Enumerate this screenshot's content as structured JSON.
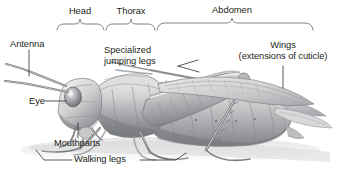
{
  "figure": {
    "background_color": "#ffffff",
    "label_color": "#231f20",
    "rule_color": "#6d6e71",
    "art_ink": "#808285"
  },
  "body_region_brackets": [
    {
      "id": "head",
      "label": "Head",
      "x_start": 57,
      "x_end": 104,
      "label_x": 80,
      "label_y": 6
    },
    {
      "id": "thorax",
      "label": "Thorax",
      "x_start": 106,
      "x_end": 155,
      "label_x": 131,
      "label_y": 6
    },
    {
      "id": "abdomen",
      "label": "Abdomen",
      "x_start": 157,
      "x_end": 313,
      "label_x": 232,
      "label_y": 6
    }
  ],
  "callouts": [
    {
      "id": "antenna",
      "label": "Antenna",
      "lines": [
        "Antenna"
      ],
      "label_x": 10,
      "label_y": 39,
      "align": "left",
      "leader": "vertical"
    },
    {
      "id": "specialized-jumping-legs",
      "label": "Specialized jumping legs",
      "lines": [
        "Specialized",
        "jumping legs"
      ],
      "label_x": 104,
      "label_y": 45,
      "align": "left",
      "leader": "forked-right"
    },
    {
      "id": "wings",
      "label": "Wings (extensions of cuticle)",
      "lines": [
        "Wings",
        "(extensions of cuticle)"
      ],
      "label_x": 283,
      "label_y": 40,
      "align": "center",
      "leader": "vertical"
    },
    {
      "id": "eye",
      "label": "Eye",
      "lines": [
        "Eye"
      ],
      "label_x": 29,
      "label_y": 97,
      "align": "left",
      "leader": "horizontal-right"
    },
    {
      "id": "mouthparts",
      "label": "Mouthparts",
      "lines": [
        "Mouthparts"
      ],
      "label_x": 54,
      "label_y": 140,
      "align": "left",
      "leader": "vertical-up"
    },
    {
      "id": "walking-legs",
      "label": "Walking legs",
      "lines": [
        "Walking legs"
      ],
      "label_x": 74,
      "label_y": 156,
      "align": "left",
      "leader": "both-sides"
    }
  ]
}
